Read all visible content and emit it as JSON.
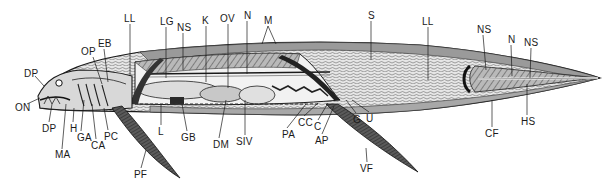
{
  "diagram": {
    "colors": {
      "ink": "#1a1a1a",
      "shade_dark": "#3a3a3a",
      "shade_mid": "#8a8a8a",
      "shade_light": "#cfcfcf",
      "paper": "#ffffff"
    },
    "labels": [
      {
        "id": "DP_top",
        "text": "DP",
        "x": 24,
        "y": 69
      },
      {
        "id": "ON",
        "text": "ON",
        "x": 15,
        "y": 103
      },
      {
        "id": "DP_bottom",
        "text": "DP",
        "x": 42,
        "y": 124
      },
      {
        "id": "MA",
        "text": "MA",
        "x": 55,
        "y": 150
      },
      {
        "id": "H",
        "text": "H",
        "x": 70,
        "y": 124
      },
      {
        "id": "GA",
        "text": "GA",
        "x": 77,
        "y": 133
      },
      {
        "id": "CA",
        "text": "CA",
        "x": 91,
        "y": 141
      },
      {
        "id": "PC",
        "text": "PC",
        "x": 104,
        "y": 132
      },
      {
        "id": "OP",
        "text": "OP",
        "x": 81,
        "y": 47
      },
      {
        "id": "EB",
        "text": "EB",
        "x": 98,
        "y": 39
      },
      {
        "id": "LL_front",
        "text": "LL",
        "x": 124,
        "y": 14
      },
      {
        "id": "LG",
        "text": "LG",
        "x": 160,
        "y": 17
      },
      {
        "id": "NS_front",
        "text": "NS",
        "x": 177,
        "y": 23
      },
      {
        "id": "K",
        "text": "K",
        "x": 202,
        "y": 16
      },
      {
        "id": "OV",
        "text": "OV",
        "x": 220,
        "y": 14
      },
      {
        "id": "N_front",
        "text": "N",
        "x": 244,
        "y": 11
      },
      {
        "id": "M",
        "text": "M",
        "x": 264,
        "y": 16
      },
      {
        "id": "S",
        "text": "S",
        "x": 368,
        "y": 11
      },
      {
        "id": "L",
        "text": "L",
        "x": 158,
        "y": 127
      },
      {
        "id": "GB",
        "text": "GB",
        "x": 181,
        "y": 133
      },
      {
        "id": "DM",
        "text": "DM",
        "x": 213,
        "y": 140
      },
      {
        "id": "SIV",
        "text": "SIV",
        "x": 236,
        "y": 137
      },
      {
        "id": "PA",
        "text": "PA",
        "x": 282,
        "y": 130
      },
      {
        "id": "CC",
        "text": "CC",
        "x": 298,
        "y": 118
      },
      {
        "id": "C",
        "text": "C",
        "x": 314,
        "y": 122
      },
      {
        "id": "AP",
        "text": "AP",
        "x": 315,
        "y": 136
      },
      {
        "id": "G",
        "text": "G",
        "x": 353,
        "y": 115
      },
      {
        "id": "U",
        "text": "U",
        "x": 366,
        "y": 114
      },
      {
        "id": "VF",
        "text": "VF",
        "x": 360,
        "y": 164
      },
      {
        "id": "PF",
        "text": "PF",
        "x": 134,
        "y": 170
      },
      {
        "id": "LL_rear",
        "text": "LL",
        "x": 422,
        "y": 17
      },
      {
        "id": "NS_mid",
        "text": "NS",
        "x": 477,
        "y": 25
      },
      {
        "id": "N_rear",
        "text": "N",
        "x": 508,
        "y": 35
      },
      {
        "id": "NS_rear",
        "text": "NS",
        "x": 524,
        "y": 38
      },
      {
        "id": "HS",
        "text": "HS",
        "x": 521,
        "y": 117
      },
      {
        "id": "CF",
        "text": "CF",
        "x": 485,
        "y": 129
      }
    ]
  }
}
